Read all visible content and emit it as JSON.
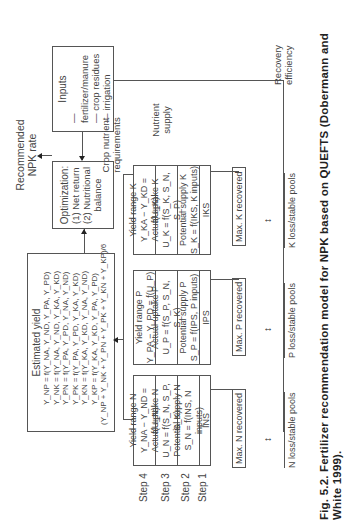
{
  "inputs_box": {
    "title": "Inputs",
    "items": [
      "— fertilizer/manure",
      "— crop residues",
      "— irrigation"
    ]
  },
  "optimization_box": {
    "title": "Optimization:",
    "items": [
      "(1) Net return",
      "(2) Nutritional",
      "balance"
    ]
  },
  "output_label": {
    "line1": "Recommended",
    "line2": "NPK rate"
  },
  "estimated_yield_box": {
    "title": "Estimated yield",
    "equations": [
      "Y_NP = f(Y_NA, Y_ND, Y_PA, Y_PD)",
      "Y_NK = f(Y_NA, Y_ND, Y_KA, Y_KD)",
      "Y_PN = f(Y_PA, Y_PD, Y_NA, Y_ND)",
      "Y_PK = f(Y_PA, Y_PD, Y_KA, Y_KD)",
      "Y_KN = f(Y_KA, Y_KD, Y_NA, Y_ND)",
      "Y_KP = f(Y_KA, Y_KD, Y_PA, Y_PD)"
    ],
    "average": "(Y_NP + Y_NK + Y_PN + Y_PK + Y_KN + Y_KP)/6"
  },
  "steps": [
    "Step 4",
    "Step 3",
    "Step 2",
    "Step 1"
  ],
  "columns": [
    {
      "nutrient": "N",
      "step4_title": "Yield range N",
      "step4_eq": "Y_NA − Y_ND = f(U_N)",
      "step3_title": "Actual uptake N",
      "step3_eq": "U_N = f(S_N, S_P, S_K)",
      "step2_title": "Potential supply N",
      "step2_eq": "S_N = f(INS, N inputs)",
      "step1": "INS",
      "max_recovered": "Max. N recovered",
      "loss": "N loss/stable pools"
    },
    {
      "nutrient": "P",
      "step4_title": "Yield range P",
      "step4_eq": "Y_PA − Y_PD = f(U_P)",
      "step3_title": "Actual uptake P",
      "step3_eq": "U_P = f(S_P, S_N, S_K)",
      "step2_title": "Potential supply P",
      "step2_eq": "S_P = f(IPS, P inputs)",
      "step1": "IPS",
      "max_recovered": "Max. P recovered",
      "loss": "P loss/stable pools"
    },
    {
      "nutrient": "K",
      "step4_title": "Yield range K",
      "step4_eq": "Y_KA − Y_KD = f(U_K)",
      "step3_title": "Actual uptake K",
      "step3_eq": "U_K = f(S_K, S_N, S_P)",
      "step2_title": "Potential supply K",
      "step2_eq": "S_K = f(IKS, K inputs)",
      "step1": "IKS",
      "max_recovered": "Max. K recovered",
      "loss": "K loss/stable pools"
    }
  ],
  "braces": {
    "crop_nutrient_requirements": [
      "Crop nutrient",
      "requirements"
    ],
    "nutrient_supply": [
      "Nutrient",
      "supply"
    ],
    "recovery_efficiency": [
      "Recovery",
      "efficiency"
    ]
  },
  "caption": "Fig. 5.2. Fertilizer recommendation model for NPK based on QUEFTS (Dobermann and White 1999)."
}
